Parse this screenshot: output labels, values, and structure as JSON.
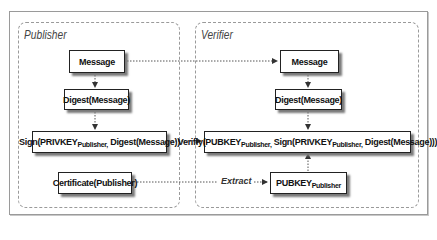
{
  "panels": {
    "publisher": {
      "title": "Publisher"
    },
    "verifier": {
      "title": "Verifier"
    }
  },
  "publisher_boxes": {
    "message": "Message",
    "digest": "Digest(Message)",
    "sign": {
      "prefix": "Sign(PRIVKEY",
      "sub": "Publisher,",
      "suffix": " Digest(Message))"
    },
    "certificate": "Certificate(Publisher)"
  },
  "verifier_boxes": {
    "message": "Message",
    "digest": "Digest(Message)",
    "verify": {
      "p1": "Verifiy(PUBKEY",
      "s1": "Publisher,",
      "p2": " Sign(PRIVKEY",
      "s2": "Publisher,",
      "p3": " Digest(Message)))"
    },
    "pubkey": {
      "prefix": "PUBKEY",
      "sub": "Publisher"
    }
  },
  "edge_labels": {
    "extract": "Extract"
  },
  "colors": {
    "border": "#222222",
    "dashed": "#9a9a9a",
    "shadow": "#7a7a7a"
  }
}
